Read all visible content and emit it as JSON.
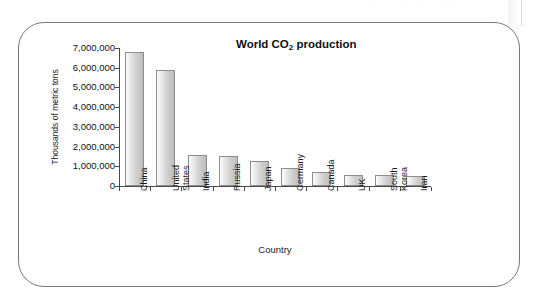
{
  "figure": {
    "frame_border_color": "#77787a",
    "background": "#ffffff",
    "faint_top_text": ". . .   . . .   . . ."
  },
  "chart_data": {
    "type": "bar",
    "title": "World CO2 production",
    "title_parts": {
      "before": "World CO",
      "sub": "2",
      "after": " production"
    },
    "xlabel": "Country",
    "ylabel": "Thousands of metric tons",
    "categories": [
      "China",
      "United States",
      "India",
      "Russia",
      "Japan",
      "Germany",
      "Canada",
      "UK",
      "South Korea",
      "Iran"
    ],
    "category_lines": [
      [
        "China"
      ],
      [
        "United",
        "States"
      ],
      [
        "India"
      ],
      [
        "Russia"
      ],
      [
        "Japan"
      ],
      [
        "Germany"
      ],
      [
        "Canada"
      ],
      [
        "UK"
      ],
      [
        "South",
        "Korea"
      ],
      [
        "Iran"
      ]
    ],
    "values": [
      6800000,
      5880000,
      1570000,
      1520000,
      1270000,
      910000,
      710000,
      580000,
      540000,
      530000
    ],
    "ylim": [
      0,
      7000000
    ],
    "yticks": [
      0,
      1000000,
      2000000,
      3000000,
      4000000,
      5000000,
      6000000,
      7000000
    ],
    "ytick_labels": [
      "0",
      "1,000,000",
      "2,000,000",
      "3,000,000",
      "4,000,000",
      "5,000,000",
      "6,000,000",
      "7,000,000"
    ],
    "grid": false,
    "legend": null,
    "bar_fill_light": "#fdfdfd",
    "bar_fill_dark": "#bdbdbd",
    "bar_border": "#8d8d8d",
    "axis_color": "#4a4a4a"
  }
}
